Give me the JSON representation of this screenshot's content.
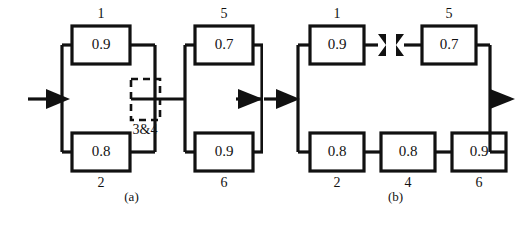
{
  "figure": {
    "background_color": "#ffffff",
    "line_color": "#111111",
    "panels": [
      {
        "id": "a",
        "caption": "(a)",
        "input_arrow": "input-arrow",
        "output_arrow": "output-arrow",
        "blocks": [
          {
            "id": "1",
            "value": "0.9",
            "position": "top-left"
          },
          {
            "id": "2",
            "value": "0.8",
            "position": "bottom-left"
          },
          {
            "id": "5",
            "value": "0.7",
            "position": "top-right"
          },
          {
            "id": "6",
            "value": "0.9",
            "position": "bottom-right"
          }
        ],
        "dashed_group": {
          "label": "3&4",
          "style": "dashed"
        }
      },
      {
        "id": "b",
        "caption": "(b)",
        "input_arrow": "input-arrow",
        "output_arrow": "output-arrow",
        "blocks": [
          {
            "id": "1",
            "value": "0.9",
            "position": "top-left"
          },
          {
            "id": "5",
            "value": "0.7",
            "position": "top-right"
          },
          {
            "id": "2",
            "value": "0.8",
            "position": "bottom-left"
          },
          {
            "id": "4",
            "value": "0.8",
            "position": "bottom-middle"
          },
          {
            "id": "6",
            "value": "0.9",
            "position": "bottom-right"
          }
        ],
        "cut_marks": [
          {
            "name": "cut-mark-left",
            "side": "left"
          },
          {
            "name": "cut-mark-right",
            "side": "right"
          }
        ]
      }
    ]
  }
}
